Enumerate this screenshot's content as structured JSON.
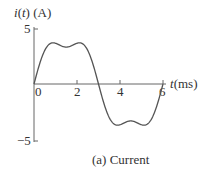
{
  "chart_data": {
    "type": "line",
    "title": "",
    "caption": "(a) Current",
    "xlabel": "t(ms)",
    "ylabel": "i(t) (A)",
    "ylabel_parts": {
      "italic_i": "i",
      "open": "(",
      "italic_t": "t",
      "rest": ") (A)"
    },
    "xlabel_parts": {
      "italic_t": "t",
      "rest": "(ms)"
    },
    "xlim": [
      0,
      6
    ],
    "ylim": [
      -5,
      5
    ],
    "x_ticks": [
      0,
      2,
      4,
      6
    ],
    "x_tick_labels": [
      "0",
      "2",
      "4",
      "6"
    ],
    "y_ticks": [
      5,
      -5
    ],
    "y_tick_labels": [
      "5",
      "−5"
    ],
    "grid": false,
    "legend": null,
    "series": [
      {
        "name": "i(t)",
        "description": "Periodic waveform: fundamental (period 6 ms) plus 3rd harmonic",
        "model": {
          "fundamental_amplitude": 4.2,
          "third_harmonic_amplitude": 0.9,
          "period_ms": 6
        },
        "key_points": [
          {
            "t": 0,
            "i": 0
          },
          {
            "t": 0.8,
            "i": 3.9
          },
          {
            "t": 1.5,
            "i": 3.3
          },
          {
            "t": 2.2,
            "i": 3.9
          },
          {
            "t": 3.0,
            "i": 0
          },
          {
            "t": 3.8,
            "i": -3.9
          },
          {
            "t": 4.5,
            "i": -3.3
          },
          {
            "t": 5.2,
            "i": -3.9
          },
          {
            "t": 6.0,
            "i": 0
          }
        ],
        "color": "#555555"
      }
    ]
  },
  "layout": {
    "origin_x": 34,
    "origin_y": 84,
    "px_per_ms": 21.5,
    "px_per_amp": 11.2,
    "axis_color": "#666666",
    "curve_color": "#555555"
  }
}
